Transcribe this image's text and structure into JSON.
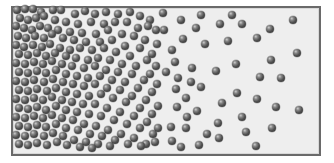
{
  "diagram": {
    "title": "",
    "colors": {
      "box_border": "#6a6a6a",
      "box_fill": "#eeeeee",
      "particle": "#4e4e4e",
      "background": "#ffffff"
    },
    "box": {
      "x": 11,
      "y": 6,
      "width": 310,
      "height": 150
    },
    "particle_diameter": 8,
    "particles": [
      [
        17,
        10
      ],
      [
        25,
        9
      ],
      [
        33,
        9
      ],
      [
        41,
        12
      ],
      [
        53,
        10
      ],
      [
        61,
        10
      ],
      [
        75,
        14
      ],
      [
        85,
        11
      ],
      [
        95,
        14
      ],
      [
        106,
        12
      ],
      [
        118,
        14
      ],
      [
        130,
        12
      ],
      [
        140,
        16
      ],
      [
        150,
        20
      ],
      [
        20,
        18
      ],
      [
        28,
        20
      ],
      [
        36,
        18
      ],
      [
        44,
        16
      ],
      [
        55,
        20
      ],
      [
        66,
        22
      ],
      [
        78,
        24
      ],
      [
        91,
        22
      ],
      [
        104,
        24
      ],
      [
        115,
        22
      ],
      [
        127,
        22
      ],
      [
        138,
        28
      ],
      [
        148,
        26
      ],
      [
        156,
        30
      ],
      [
        16,
        26
      ],
      [
        24,
        28
      ],
      [
        32,
        30
      ],
      [
        40,
        26
      ],
      [
        48,
        28
      ],
      [
        58,
        30
      ],
      [
        70,
        32
      ],
      [
        82,
        33
      ],
      [
        96,
        34
      ],
      [
        108,
        30
      ],
      [
        122,
        34
      ],
      [
        134,
        36
      ],
      [
        145,
        40
      ],
      [
        157,
        44
      ],
      [
        18,
        36
      ],
      [
        26,
        38
      ],
      [
        35,
        36
      ],
      [
        44,
        38
      ],
      [
        52,
        34
      ],
      [
        63,
        38
      ],
      [
        74,
        40
      ],
      [
        86,
        42
      ],
      [
        100,
        42
      ],
      [
        112,
        40
      ],
      [
        125,
        46
      ],
      [
        140,
        48
      ],
      [
        152,
        54
      ],
      [
        16,
        45
      ],
      [
        24,
        47
      ],
      [
        33,
        45
      ],
      [
        42,
        47
      ],
      [
        50,
        44
      ],
      [
        60,
        48
      ],
      [
        70,
        50
      ],
      [
        80,
        48
      ],
      [
        92,
        50
      ],
      [
        104,
        48
      ],
      [
        116,
        52
      ],
      [
        130,
        56
      ],
      [
        147,
        60
      ],
      [
        156,
        66
      ],
      [
        19,
        54
      ],
      [
        28,
        55
      ],
      [
        37,
        53
      ],
      [
        46,
        56
      ],
      [
        55,
        53
      ],
      [
        66,
        56
      ],
      [
        76,
        58
      ],
      [
        88,
        60
      ],
      [
        98,
        58
      ],
      [
        110,
        60
      ],
      [
        122,
        64
      ],
      [
        136,
        66
      ],
      [
        150,
        74
      ],
      [
        16,
        63
      ],
      [
        25,
        64
      ],
      [
        34,
        62
      ],
      [
        43,
        64
      ],
      [
        52,
        61
      ],
      [
        62,
        64
      ],
      [
        72,
        66
      ],
      [
        84,
        68
      ],
      [
        95,
        66
      ],
      [
        106,
        70
      ],
      [
        118,
        72
      ],
      [
        132,
        74
      ],
      [
        144,
        80
      ],
      [
        157,
        84
      ],
      [
        19,
        72
      ],
      [
        28,
        73
      ],
      [
        37,
        71
      ],
      [
        46,
        73
      ],
      [
        56,
        70
      ],
      [
        66,
        74
      ],
      [
        77,
        76
      ],
      [
        88,
        78
      ],
      [
        100,
        76
      ],
      [
        112,
        80
      ],
      [
        125,
        82
      ],
      [
        138,
        88
      ],
      [
        152,
        92
      ],
      [
        16,
        81
      ],
      [
        25,
        82
      ],
      [
        34,
        80
      ],
      [
        44,
        82
      ],
      [
        53,
        79
      ],
      [
        63,
        82
      ],
      [
        73,
        84
      ],
      [
        84,
        86
      ],
      [
        95,
        84
      ],
      [
        107,
        88
      ],
      [
        120,
        90
      ],
      [
        132,
        96
      ],
      [
        146,
        100
      ],
      [
        158,
        106
      ],
      [
        19,
        90
      ],
      [
        28,
        91
      ],
      [
        37,
        89
      ],
      [
        47,
        91
      ],
      [
        56,
        88
      ],
      [
        66,
        92
      ],
      [
        77,
        94
      ],
      [
        89,
        96
      ],
      [
        101,
        94
      ],
      [
        113,
        98
      ],
      [
        126,
        102
      ],
      [
        140,
        108
      ],
      [
        152,
        114
      ],
      [
        16,
        99
      ],
      [
        25,
        100
      ],
      [
        34,
        98
      ],
      [
        43,
        100
      ],
      [
        52,
        97
      ],
      [
        62,
        100
      ],
      [
        72,
        102
      ],
      [
        83,
        104
      ],
      [
        95,
        104
      ],
      [
        107,
        108
      ],
      [
        120,
        112
      ],
      [
        134,
        116
      ],
      [
        147,
        122
      ],
      [
        158,
        128
      ],
      [
        19,
        108
      ],
      [
        28,
        109
      ],
      [
        37,
        107
      ],
      [
        46,
        110
      ],
      [
        56,
        106
      ],
      [
        66,
        110
      ],
      [
        77,
        112
      ],
      [
        89,
        114
      ],
      [
        101,
        116
      ],
      [
        114,
        120
      ],
      [
        127,
        124
      ],
      [
        140,
        128
      ],
      [
        153,
        134
      ],
      [
        16,
        117
      ],
      [
        25,
        118
      ],
      [
        34,
        116
      ],
      [
        43,
        118
      ],
      [
        52,
        115
      ],
      [
        62,
        118
      ],
      [
        73,
        120
      ],
      [
        84,
        124
      ],
      [
        96,
        126
      ],
      [
        108,
        130
      ],
      [
        121,
        134
      ],
      [
        134,
        138
      ],
      [
        146,
        144
      ],
      [
        19,
        126
      ],
      [
        28,
        127
      ],
      [
        37,
        125
      ],
      [
        46,
        127
      ],
      [
        56,
        124
      ],
      [
        66,
        128
      ],
      [
        78,
        130
      ],
      [
        90,
        134
      ],
      [
        102,
        136
      ],
      [
        115,
        140
      ],
      [
        128,
        144
      ],
      [
        141,
        146
      ],
      [
        155,
        142
      ],
      [
        16,
        135
      ],
      [
        25,
        136
      ],
      [
        34,
        134
      ],
      [
        44,
        136
      ],
      [
        53,
        133
      ],
      [
        63,
        136
      ],
      [
        74,
        140
      ],
      [
        86,
        142
      ],
      [
        98,
        144
      ],
      [
        110,
        146
      ],
      [
        19,
        144
      ],
      [
        28,
        145
      ],
      [
        37,
        143
      ],
      [
        47,
        145
      ],
      [
        57,
        142
      ],
      [
        67,
        145
      ],
      [
        80,
        147
      ],
      [
        92,
        148
      ],
      [
        163,
        13
      ],
      [
        181,
        20
      ],
      [
        201,
        15
      ],
      [
        232,
        15
      ],
      [
        196,
        28
      ],
      [
        220,
        24
      ],
      [
        242,
        24
      ],
      [
        164,
        30
      ],
      [
        183,
        39
      ],
      [
        205,
        44
      ],
      [
        228,
        41
      ],
      [
        172,
        50
      ],
      [
        175,
        62
      ],
      [
        236,
        64
      ],
      [
        166,
        72
      ],
      [
        192,
        68
      ],
      [
        216,
        71
      ],
      [
        178,
        78
      ],
      [
        191,
        82
      ],
      [
        176,
        89
      ],
      [
        201,
        87
      ],
      [
        237,
        93
      ],
      [
        186,
        98
      ],
      [
        222,
        103
      ],
      [
        177,
        107
      ],
      [
        197,
        111
      ],
      [
        187,
        117
      ],
      [
        242,
        117
      ],
      [
        171,
        127
      ],
      [
        186,
        128
      ],
      [
        218,
        123
      ],
      [
        207,
        134
      ],
      [
        246,
        132
      ],
      [
        172,
        141
      ],
      [
        219,
        138
      ],
      [
        181,
        147
      ],
      [
        199,
        145
      ],
      [
        293,
        20
      ],
      [
        270,
        29
      ],
      [
        257,
        38
      ],
      [
        297,
        53
      ],
      [
        271,
        60
      ],
      [
        260,
        77
      ],
      [
        281,
        78
      ],
      [
        257,
        99
      ],
      [
        276,
        107
      ],
      [
        299,
        110
      ],
      [
        272,
        128
      ],
      [
        256,
        146
      ]
    ]
  }
}
